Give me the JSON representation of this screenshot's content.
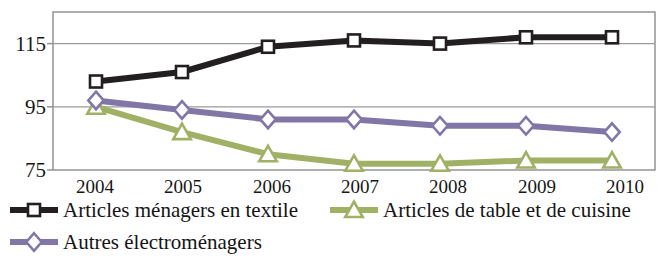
{
  "chart_data": {
    "type": "line",
    "title": "",
    "subtitle": "",
    "xlabel": "",
    "ylabel": "",
    "categories": [
      "2004",
      "2005",
      "2006",
      "2007",
      "2008",
      "2009",
      "2010"
    ],
    "x": [
      2004,
      2005,
      2006,
      2007,
      2008,
      2009,
      2010
    ],
    "yticks": [
      75,
      95,
      115
    ],
    "ytick_labels": [
      "75",
      "95",
      "115"
    ],
    "ylim": [
      75,
      125
    ],
    "grid": true,
    "grid_axis": "y",
    "legend_position": "bottom",
    "series": [
      {
        "name": "Articles ménagers en textile",
        "color": "#231f20",
        "marker": "square",
        "marker_fill": "#ffffff",
        "values": [
          103,
          106,
          114,
          116,
          115,
          117,
          117
        ]
      },
      {
        "name": "Articles de table et de cuisine",
        "color": "#a0b165",
        "marker": "triangle",
        "marker_fill": "#ffffff",
        "values": [
          95,
          87,
          80,
          77,
          77,
          78,
          78
        ]
      },
      {
        "name": "Autres électroménagers",
        "color": "#8176a6",
        "marker": "diamond",
        "marker_fill": "#ffffff",
        "values": [
          97,
          94,
          91,
          91,
          89,
          89,
          87
        ]
      }
    ]
  },
  "axis": {
    "ytick_0": "75",
    "ytick_1": "95",
    "ytick_2": "115",
    "xtick_0": "2004",
    "xtick_1": "2005",
    "xtick_2": "2006",
    "xtick_3": "2007",
    "xtick_4": "2008",
    "xtick_5": "2009",
    "xtick_6": "2010"
  },
  "legend": {
    "items": [
      {
        "label": "Articles ménagers en textile",
        "color": "#231f20",
        "marker": "square"
      },
      {
        "label": "Articles de table et de cuisine",
        "color": "#a0b165",
        "marker": "triangle"
      },
      {
        "label": "Autres électroménagers",
        "color": "#8176a6",
        "marker": "diamond"
      }
    ]
  }
}
